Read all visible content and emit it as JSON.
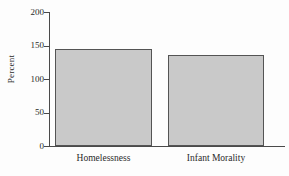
{
  "chart_data": {
    "type": "bar",
    "title": "",
    "subtitle": "",
    "xlabel": "",
    "ylabel": "Percent",
    "categories": [
      "Homelessness",
      "Infant Morality"
    ],
    "values": [
      145,
      136
    ],
    "ylim": [
      0,
      200
    ],
    "yticks": [
      0,
      50,
      100,
      150,
      200
    ],
    "ytick_labels": [
      "0",
      "50",
      "100",
      "150",
      "200"
    ],
    "grid": false,
    "legend": null,
    "legend_position": "none",
    "annotations": [],
    "bar_fill_color": "#c9c9c9",
    "bar_edge_color": "#545454",
    "axis_color": "#4a4a4a",
    "background_color": "#fdfdfd"
  },
  "axes": {
    "y": {
      "label": "Percent",
      "ticks": [
        {
          "value": 200,
          "label": "200"
        },
        {
          "value": 150,
          "label": "150"
        },
        {
          "value": 100,
          "label": "100"
        },
        {
          "value": 50,
          "label": "50"
        },
        {
          "value": 0,
          "label": "0"
        }
      ]
    },
    "x": {
      "label": "",
      "ticks": [
        {
          "label": "Homelessness"
        },
        {
          "label": "Infant Morality"
        }
      ]
    }
  }
}
